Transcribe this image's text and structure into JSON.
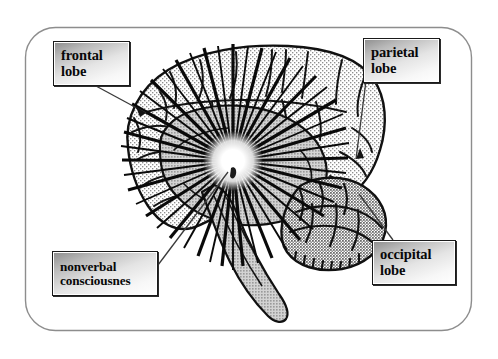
{
  "figure": {
    "type": "anatomical-diagram",
    "frame": {
      "shape": "rounded-rectangle",
      "border_color": "#8a8a8a"
    },
    "background_color": "#ffffff",
    "ink_color": "#111111"
  },
  "labels": [
    {
      "id": "frontal-lobe",
      "lines": [
        "frontal",
        "lobe"
      ],
      "box": {
        "x": 53,
        "y": 41,
        "w": 77,
        "h": 45
      },
      "leader": {
        "from_x": 96,
        "to_x": 146,
        "from_y": 86,
        "to_y": 113
      },
      "arrow": true
    },
    {
      "id": "parietal-lobe",
      "lines": [
        "parietal",
        "lobe"
      ],
      "box": {
        "x": 363,
        "y": 38,
        "w": 77,
        "h": 45
      },
      "leader": {
        "from_x": 366,
        "to_x": 356,
        "from_y": 81,
        "to_y": 159
      },
      "arrow": true
    },
    {
      "id": "occipital-lobe",
      "lines": [
        "occipital",
        "lobe"
      ],
      "box": {
        "x": 372,
        "y": 240,
        "w": 84,
        "h": 45
      },
      "leader": {
        "from_x": 393,
        "to_x": 359,
        "from_y": 240,
        "to_y": 194
      },
      "arrow": false
    },
    {
      "id": "nonverbal-consciousness",
      "lines": [
        "nonverbal",
        "consciousnes"
      ],
      "box": {
        "x": 52,
        "y": 251,
        "w": 106,
        "h": 45
      },
      "leader": {
        "from_x": 158,
        "to_x": 228,
        "from_y": 265,
        "to_y": 172
      },
      "arrow": false
    }
  ],
  "brain": {
    "starburst": {
      "center_x": 233,
      "center_y": 161,
      "ray_count": 46
    },
    "regions": [
      {
        "name": "cerebral-cortex",
        "fill": "light-stipple"
      },
      {
        "name": "central-thalamic-mass",
        "fill": "medium-gray"
      },
      {
        "name": "cerebellum",
        "fill": "dark-stipple"
      },
      {
        "name": "brainstem",
        "fill": "medium-gray"
      }
    ]
  }
}
